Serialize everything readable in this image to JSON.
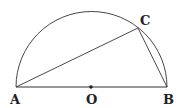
{
  "diagram": {
    "type": "semicircle-with-inscribed-triangle",
    "stroke_color": "#333333",
    "points": {
      "A": {
        "label": "A",
        "x": 16,
        "y": 87
      },
      "B": {
        "label": "B",
        "x": 167,
        "y": 87
      },
      "O": {
        "label": "O",
        "x": 91,
        "y": 87
      },
      "C": {
        "label": "C",
        "x": 138,
        "y": 28
      }
    },
    "segments": [
      "AB",
      "AC",
      "CB"
    ],
    "arc": "semicircle over AB centered at O"
  }
}
